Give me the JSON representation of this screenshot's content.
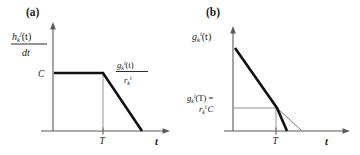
{
  "figure": {
    "background": "#ffffff",
    "width": 360,
    "height": 155
  },
  "panels": [
    {
      "id": "a",
      "label": "(a)",
      "y_axis_label": {
        "type": "fraction",
        "numerator": "h_k^j(t)",
        "denominator": "dt",
        "numerator_parts": {
          "base": "h",
          "sub": "k",
          "sup": "j",
          "arg": "(t)"
        },
        "denominator_parts": {
          "text": "dt"
        }
      },
      "y_tick_label": "C",
      "x_tick_label": "T",
      "x_axis_name": "t",
      "curve_annotation": {
        "type": "fraction",
        "numerator": "g_k^i(t)",
        "denominator": "r_k^i",
        "numerator_parts": {
          "base": "g",
          "sub": "k",
          "sup": "i",
          "arg": "(t)"
        },
        "denominator_parts": {
          "base": "r",
          "sub": "k",
          "sup": "i"
        }
      },
      "curve_description": "constant at C until T then linear decrease to zero"
    },
    {
      "id": "b",
      "label": "(b)",
      "y_axis_label": {
        "type": "expression",
        "text": "g_k^i(t)",
        "parts": {
          "base": "g",
          "sub": "k",
          "sup": "i",
          "arg": "(t)"
        }
      },
      "y_tick_label": {
        "type": "two-line",
        "line1": "g_k^i(T) =",
        "line2": "r_k^i C",
        "line1_parts": {
          "base": "g",
          "sub": "k",
          "sup": "i",
          "arg": "(T)",
          "equals": "="
        },
        "line2_parts": {
          "base": "r",
          "sub": "k",
          "sup": "i",
          "tail": "C"
        }
      },
      "x_tick_label": "T",
      "x_axis_name": "t",
      "curve_description": "linear decrease, steeper drop to zero after T, with thin line extending original slope"
    }
  ],
  "colors": {
    "axis": "#5a5a5a",
    "curve_thick": "#111111",
    "curve_thin": "#6b6b6b",
    "guide": "#8a8a8a",
    "text": "#161616"
  }
}
